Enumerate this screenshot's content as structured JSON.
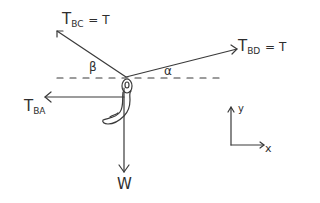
{
  "diagram": {
    "type": "free-body-diagram",
    "forces": [
      {
        "id": "T_BC",
        "symbol": "T",
        "subscript": "BC",
        "equation": "= T",
        "direction": "up-left"
      },
      {
        "id": "T_BD",
        "symbol": "T",
        "subscript": "BD",
        "equation": "= T",
        "direction": "up-right"
      },
      {
        "id": "T_BA",
        "symbol": "T",
        "subscript": "BA",
        "direction": "left"
      },
      {
        "id": "W",
        "symbol": "W",
        "direction": "down"
      }
    ],
    "angles": {
      "beta": "β",
      "alpha": "α"
    },
    "axes": {
      "x": "x",
      "y": "y"
    },
    "colors": {
      "ink": "#3a3a3a",
      "background": "#ffffff"
    }
  }
}
